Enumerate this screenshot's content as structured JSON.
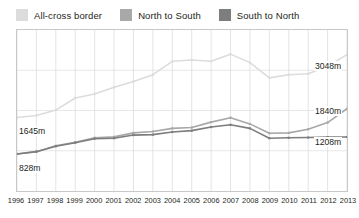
{
  "legend": {
    "position": "top-left",
    "items": [
      {
        "label": "All-cross border",
        "color": "#dcdcdc",
        "swatch_name": "legend-swatch-all-cross-border"
      },
      {
        "label": "North to South",
        "color": "#a8a8a8",
        "swatch_name": "legend-swatch-north-to-south"
      },
      {
        "label": "South to North",
        "color": "#7d7d7d",
        "swatch_name": "legend-swatch-south-to-north"
      }
    ]
  },
  "value_labels": {
    "left_upper": "1645m",
    "left_lower": "828m",
    "right_top": "3048m",
    "right_mid": "1840m",
    "right_low": "1208m"
  },
  "chart_data": {
    "type": "line",
    "title": "",
    "subtitle": "",
    "xlabel": "",
    "ylabel": "",
    "grid": true,
    "grid_axis": "both",
    "legend_position": "top-left",
    "units": "m",
    "categories": [
      "1996",
      "1997",
      "1998",
      "1999",
      "2000",
      "2001",
      "2002",
      "2003",
      "2004",
      "2005",
      "2006",
      "2007",
      "2008",
      "2009",
      "2010",
      "2011",
      "2012",
      "2013"
    ],
    "xlim": [
      "1996",
      "2013"
    ],
    "ylim": [
      0,
      3600
    ],
    "yticks": [
      900,
      1800,
      2700
    ],
    "series": [
      {
        "name": "All-cross border",
        "color": "#dcdcdc",
        "values": [
          1645,
          1690,
          1810,
          2080,
          2170,
          2320,
          2450,
          2600,
          2900,
          2930,
          2900,
          3060,
          2870,
          2530,
          2600,
          2620,
          2790,
          3048
        ],
        "endpoint_label_start": "1645m",
        "endpoint_label_end": "3048m"
      },
      {
        "name": "North to South",
        "color": "#a8a8a8",
        "values": [
          828,
          880,
          1010,
          1090,
          1190,
          1210,
          1300,
          1330,
          1400,
          1420,
          1540,
          1640,
          1500,
          1290,
          1300,
          1380,
          1530,
          1840
        ],
        "endpoint_label_start": "828m",
        "endpoint_label_end": "1840m"
      },
      {
        "name": "South to North",
        "color": "#7d7d7d",
        "values": [
          828,
          880,
          1000,
          1080,
          1170,
          1180,
          1250,
          1260,
          1320,
          1350,
          1430,
          1480,
          1400,
          1180,
          1190,
          1195,
          1205,
          1208
        ],
        "endpoint_label_start": "828m",
        "endpoint_label_end": "1208m"
      }
    ]
  }
}
